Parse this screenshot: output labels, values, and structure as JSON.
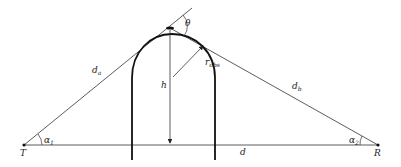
{
  "diagram": {
    "colors": {
      "line": "#222222",
      "obstacle": "#111111",
      "background": "#ffffff"
    },
    "points": {
      "T": {
        "label": "T",
        "x": 24,
        "y": 145
      },
      "R": {
        "label": "R",
        "x": 378,
        "y": 145
      },
      "apex": {
        "x": 170,
        "y": 28
      }
    },
    "labels": {
      "d_a": {
        "base": "d",
        "sub": "a"
      },
      "d_b": {
        "base": "d",
        "sub": "b"
      },
      "d": {
        "base": "d"
      },
      "h": {
        "base": "h"
      },
      "r_obs": {
        "base": "r",
        "sub": "obs"
      },
      "theta": {
        "base": "θ"
      },
      "alpha1": {
        "base": "α",
        "sub": "1"
      },
      "alpha2": {
        "base": "α",
        "sub": "2"
      },
      "T": {
        "base": "T"
      },
      "R": {
        "base": "R"
      }
    }
  }
}
